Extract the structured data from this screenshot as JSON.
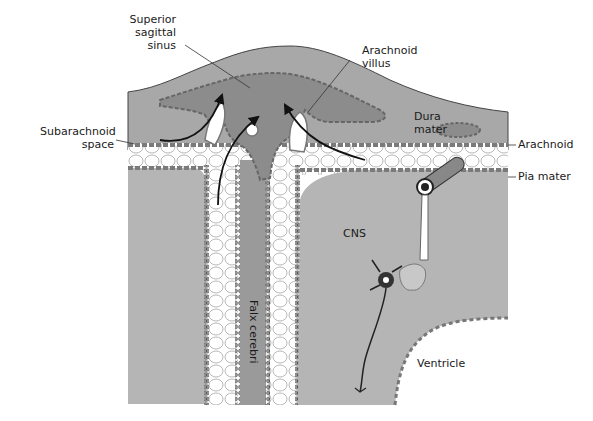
{
  "figure": {
    "type": "anatomical-diagram",
    "colors": {
      "background": "#ffffff",
      "dura": "#a8a8a8",
      "sinus": "#8c8c8c",
      "cns": "#b5b5b5",
      "subarachnoid": "#ffffff",
      "membrane_cells": "#7a7a7a",
      "lines": "#333333",
      "arrows": "#111111"
    }
  },
  "labels": {
    "superior_sagittal_sinus": [
      "Superior",
      "sagittal",
      "sinus"
    ],
    "arachnoid_villus": [
      "Arachnoid",
      "villus"
    ],
    "subarachnoid_space": [
      "Subarachnoid",
      "space"
    ],
    "dura_mater": [
      "Dura",
      "mater"
    ],
    "arachnoid": "Arachnoid",
    "pia_mater": "Pia mater",
    "cns": "CNS",
    "falx_cerebri": "Falx cerebri",
    "ventricle": "Ventricle"
  }
}
